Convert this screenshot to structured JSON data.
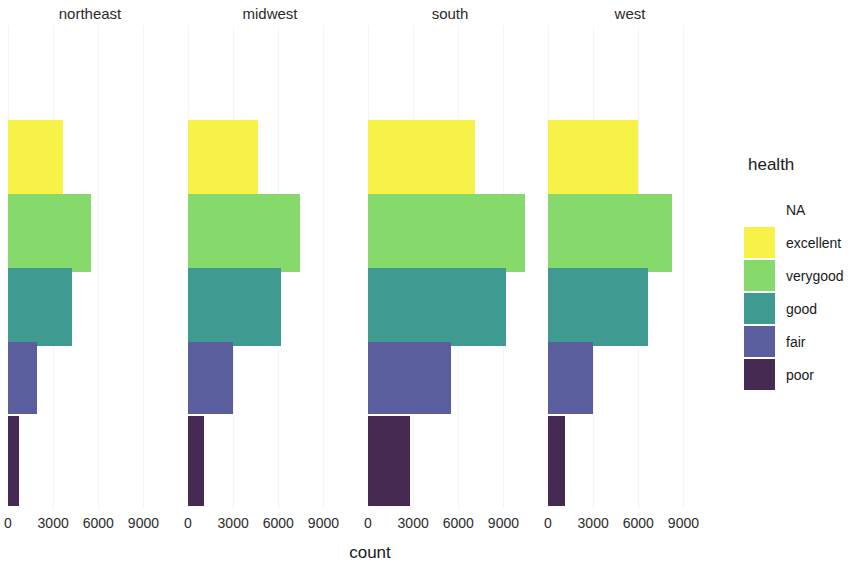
{
  "chart_data": {
    "type": "bar",
    "orientation": "horizontal",
    "stacked": false,
    "title": "",
    "xlabel": "count",
    "ylabel": "",
    "facet_variable": "region",
    "facets": [
      "northeast",
      "midwest",
      "south",
      "west"
    ],
    "legend_title": "health",
    "legend_position": "right",
    "categories": [
      "excellent",
      "verygood",
      "good",
      "fair",
      "poor"
    ],
    "xticks": [
      "0",
      "3000",
      "6000",
      "9000"
    ],
    "xtick_values": [
      0,
      3000,
      6000,
      9000
    ],
    "xlim": [
      0,
      11200
    ],
    "grid": true,
    "series": [
      {
        "name": "northeast",
        "values": [
          3650,
          5500,
          4250,
          1900,
          720
        ]
      },
      {
        "name": "midwest",
        "values": [
          4650,
          7450,
          6200,
          3000,
          1050
        ]
      },
      {
        "name": "south",
        "values": [
          7100,
          10400,
          9200,
          5500,
          2800
        ]
      },
      {
        "name": "west",
        "values": [
          6000,
          8250,
          6650,
          3000,
          1100
        ]
      }
    ],
    "colors": {
      "excellent": "#F7F248",
      "verygood": "#86D96B",
      "good": "#3F9B91",
      "fair": "#5B5E9D",
      "poor": "#462A52"
    }
  },
  "legend": {
    "title": "health",
    "items": [
      {
        "label": "NA",
        "color": null,
        "has_swatch": false
      },
      {
        "label": "excellent",
        "color": "#F7F248",
        "has_swatch": true
      },
      {
        "label": "verygood",
        "color": "#86D96B",
        "has_swatch": true
      },
      {
        "label": "good",
        "color": "#3F9B91",
        "has_swatch": true
      },
      {
        "label": "fair",
        "color": "#5B5E9D",
        "has_swatch": true
      },
      {
        "label": "poor",
        "color": "#462A52",
        "has_swatch": true
      }
    ]
  },
  "axis": {
    "x_title": "count",
    "x_ticks": [
      "0",
      "3000",
      "6000",
      "9000"
    ]
  },
  "facet_labels": [
    "northeast",
    "midwest",
    "south",
    "west"
  ]
}
